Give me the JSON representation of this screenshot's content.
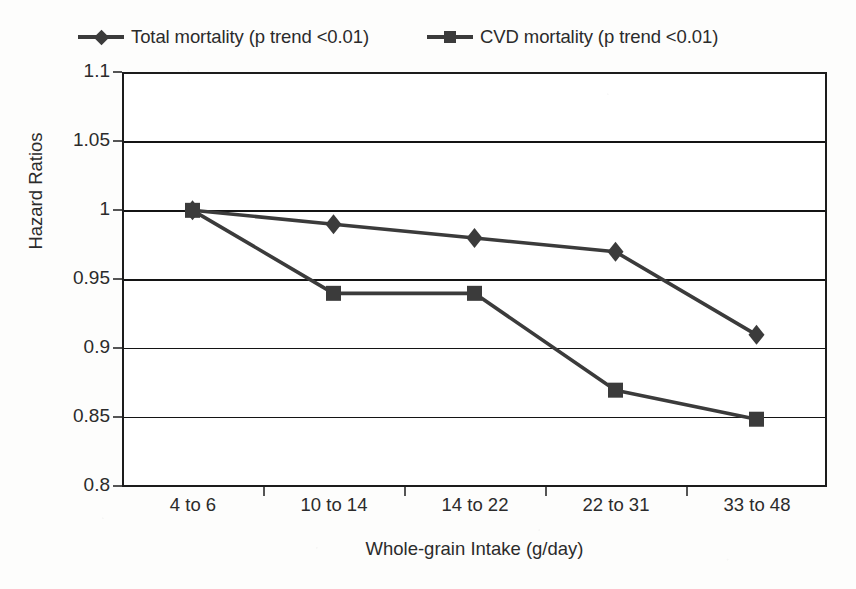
{
  "chart_data": {
    "type": "line",
    "title": "",
    "xlabel": "Whole-grain Intake (g/day)",
    "ylabel": "Hazard Ratios",
    "categories": [
      "4 to 6",
      "10 to 14",
      "14 to 22",
      "22 to 31",
      "33 to 48"
    ],
    "ylim": [
      0.8,
      1.1
    ],
    "yticks": [
      "0.8",
      "0.85",
      "0.9",
      "0.95",
      "1",
      "1.05",
      "1.1"
    ],
    "ytick_values": [
      0.8,
      0.85,
      0.9,
      0.95,
      1.0,
      1.05,
      1.1
    ],
    "grid": true,
    "legend_position": "top",
    "series": [
      {
        "name": "Total mortality (p trend <0.01)",
        "marker": "diamond",
        "color": "#3b3b3b",
        "values": [
          1.0,
          0.99,
          0.98,
          0.97,
          0.91
        ]
      },
      {
        "name": "CVD mortality (p trend <0.01)",
        "marker": "square",
        "color": "#3b3b3b",
        "values": [
          1.0,
          0.94,
          0.94,
          0.87,
          0.849
        ]
      }
    ]
  },
  "legend": {
    "entries": [
      {
        "label": "Total mortality (p trend <0.01)",
        "marker": "diamond"
      },
      {
        "label": "CVD mortality (p trend <0.01)",
        "marker": "square"
      }
    ]
  },
  "axes": {
    "y_title": "Hazard Ratios",
    "x_title": "Whole-grain Intake (g/day)",
    "y_labels": [
      "1.1",
      "1.05",
      "1",
      "0.95",
      "0.9",
      "0.85",
      "0.8"
    ],
    "x_labels": [
      "4 to 6",
      "10 to 14",
      "14 to 22",
      "22 to 31",
      "33 to 48"
    ]
  },
  "colors": {
    "line": "#3b3b3b",
    "grid": "#141414",
    "frame": "#1c1c1c",
    "text": "#2b2b2b",
    "background": "#ffffff"
  }
}
